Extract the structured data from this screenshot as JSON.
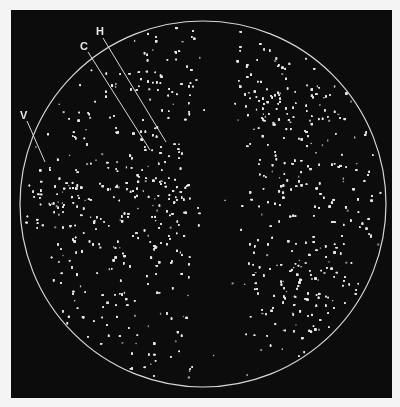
{
  "figure": {
    "background_color": "#0c0c0c",
    "page_color": "#f4f4f4",
    "speckle_color": "#e6e6e6",
    "outline_color": "#d8d8d8",
    "circle": {
      "cx": 203,
      "cy": 204,
      "r": 183
    },
    "labels": [
      {
        "id": "H",
        "text": "H",
        "x": 96,
        "y": 26,
        "line": [
          103,
          38,
          166,
          142
        ]
      },
      {
        "id": "C",
        "text": "C",
        "x": 80,
        "y": 41,
        "line": [
          88,
          52,
          150,
          150
        ]
      },
      {
        "id": "V",
        "text": "V",
        "x": 20,
        "y": 110,
        "line": [
          27,
          121,
          45,
          162
        ]
      }
    ],
    "regions": {
      "dark_band": {
        "x_center": 218,
        "half_width_top": 10,
        "half_width_bottom": 26
      },
      "bright_clusters": [
        {
          "name": "left-center",
          "cx": 155,
          "cy": 205,
          "r": 55
        },
        {
          "name": "upper-right",
          "cx": 285,
          "cy": 110,
          "r": 60
        },
        {
          "name": "lower-right",
          "cx": 295,
          "cy": 280,
          "r": 50
        },
        {
          "name": "left-edge",
          "cx": 60,
          "cy": 200,
          "r": 40
        }
      ]
    }
  }
}
